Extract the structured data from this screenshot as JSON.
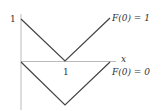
{
  "diagram": {
    "axes": {
      "y_tick_label": "1",
      "x_tick_label": "1",
      "x_axis_label": "x"
    },
    "curves": [
      {
        "label": "F(0) = 1",
        "points": [
          [
            0,
            1
          ],
          [
            1,
            0
          ],
          [
            2,
            1
          ]
        ]
      },
      {
        "label": "F(0) = 0",
        "points": [
          [
            0,
            0
          ],
          [
            1,
            -1
          ],
          [
            2,
            0
          ]
        ]
      }
    ],
    "colors": {
      "axis": "#bbbbbb",
      "curve": "#444444",
      "text": "#333333"
    }
  }
}
